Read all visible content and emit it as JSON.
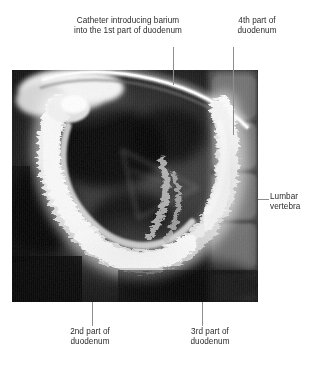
{
  "figure": {
    "type": "radiograph",
    "modality": "barium contrast X-ray",
    "subject": "duodenum",
    "background_color": "#ffffff",
    "text_color": "#2b2b2b",
    "leader_line_color": "#8e8e8e",
    "image_bounds": {
      "x": 12,
      "y": 70,
      "width": 246,
      "height": 232
    }
  },
  "annotations": {
    "catheter": {
      "text": "Catheter introducing barium\ninto the 1st part of duodenum",
      "position": "top-left",
      "leader": {
        "orientation": "vertical",
        "x": 173,
        "y1": 47,
        "y2": 85
      }
    },
    "fourth_part": {
      "text": "4th part of\nduodenum",
      "position": "top-right",
      "leader": {
        "orientation": "vertical",
        "x": 233,
        "y1": 47,
        "y2": 135
      }
    },
    "lumbar_vertebra": {
      "text": "Lumbar\nvertebra",
      "position": "right",
      "leader": {
        "orientation": "horizontal",
        "y": 199,
        "x1": 258,
        "x2": 269
      }
    },
    "second_part": {
      "text": "2nd part of\nduodenum",
      "position": "bottom-left",
      "leader": {
        "orientation": "vertical",
        "x": 92,
        "y1": 302,
        "y2": 326
      }
    },
    "third_part": {
      "text": "3rd part of\nduodenum",
      "position": "bottom-right",
      "leader": {
        "orientation": "vertical",
        "x": 202,
        "y1": 302,
        "y2": 326
      }
    }
  },
  "icons": {
    "radiograph": "xray-image"
  }
}
